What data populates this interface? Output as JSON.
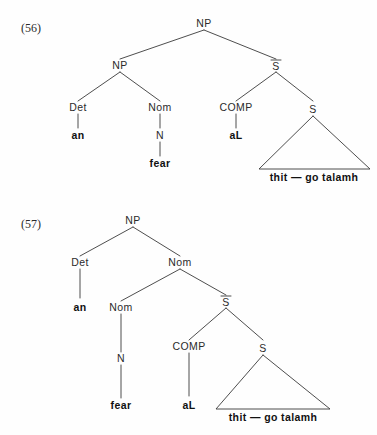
{
  "page": {
    "background_color": "#fefefe",
    "ink_color": "#2b2b2b",
    "line_color": "#3a3a3a"
  },
  "examples": [
    {
      "id": "56",
      "number_label": "(56)",
      "description": "Syntax tree: NP dominating NP and S-bar",
      "nodes": {
        "root_np": "NP",
        "left_np": "NP",
        "det": "Det",
        "nom": "Nom",
        "n": "N",
        "sbar": "S",
        "comp": "COMP",
        "s": "S"
      },
      "terminals": {
        "det_word": "an",
        "n_word": "fear",
        "comp_word": "aL",
        "clause": "thit — go talamh"
      }
    },
    {
      "id": "57",
      "number_label": "(57)",
      "description": "Syntax tree: NP dominating Det and Nom, Nom dominating Nom and S-bar",
      "nodes": {
        "root_np": "NP",
        "det": "Det",
        "nom_upper": "Nom",
        "nom_lower": "Nom",
        "n": "N",
        "sbar": "S",
        "comp": "COMP",
        "s": "S"
      },
      "terminals": {
        "det_word": "an",
        "n_word": "fear",
        "comp_word": "aL",
        "clause": "thit — go talamh"
      }
    }
  ]
}
